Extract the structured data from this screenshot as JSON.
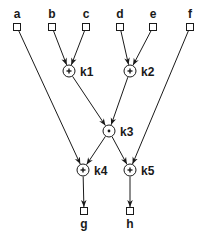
{
  "diagram": {
    "type": "dataflow-graph",
    "inputs": [
      {
        "id": "a",
        "label": "a",
        "x": 17,
        "y": 27
      },
      {
        "id": "b",
        "label": "b",
        "x": 52,
        "y": 27
      },
      {
        "id": "c",
        "label": "c",
        "x": 86,
        "y": 27
      },
      {
        "id": "d",
        "label": "d",
        "x": 120,
        "y": 27
      },
      {
        "id": "e",
        "label": "e",
        "x": 153,
        "y": 27
      },
      {
        "id": "f",
        "label": "f",
        "x": 190,
        "y": 27
      }
    ],
    "operations": [
      {
        "id": "k1",
        "label": "k1",
        "op": "+",
        "x": 69,
        "y": 71
      },
      {
        "id": "k2",
        "label": "k2",
        "op": "+",
        "x": 130,
        "y": 71
      },
      {
        "id": "k3",
        "label": "k3",
        "op": "•",
        "x": 109,
        "y": 131
      },
      {
        "id": "k4",
        "label": "k4",
        "op": "+",
        "x": 83,
        "y": 170
      },
      {
        "id": "k5",
        "label": "k5",
        "op": "+",
        "x": 130,
        "y": 170
      }
    ],
    "outputs": [
      {
        "id": "g",
        "label": "g",
        "x": 84,
        "y": 211
      },
      {
        "id": "h",
        "label": "h",
        "x": 130,
        "y": 211
      }
    ],
    "edges": [
      [
        "b",
        "k1"
      ],
      [
        "c",
        "k1"
      ],
      [
        "d",
        "k2"
      ],
      [
        "e",
        "k2"
      ],
      [
        "k1",
        "k3"
      ],
      [
        "k2",
        "k3"
      ],
      [
        "a",
        "k4"
      ],
      [
        "k3",
        "k4"
      ],
      [
        "k3",
        "k5"
      ],
      [
        "f",
        "k5"
      ],
      [
        "k4",
        "g"
      ],
      [
        "k5",
        "h"
      ]
    ]
  }
}
